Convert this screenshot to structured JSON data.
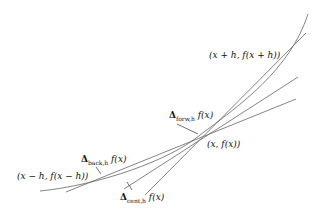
{
  "diagram": {
    "labels": {
      "point_plus": "(x + h, f(x + h))",
      "point_center": "(x, f(x))",
      "point_minus": "(x − h, f(x − h))",
      "forw_sym": "Δ",
      "forw_sub": "forw,h",
      "forw_rest": " f(x)",
      "back_sym": "Δ",
      "back_sub": "back,h",
      "back_rest": " f(x)",
      "cent_sym": "Δ",
      "cent_sub": "cent,h",
      "cent_rest": " f(x)"
    },
    "elements": [
      "curve f",
      "forward secant",
      "backward secant",
      "central secant",
      "tangent"
    ],
    "line_color": "#666666"
  }
}
